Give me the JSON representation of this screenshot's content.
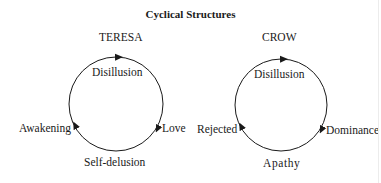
{
  "title": "Cyclical Structures",
  "cycles": [
    {
      "name": "TERESA",
      "top": "Disillusion",
      "right": "Love",
      "bottom": "Self-delusion",
      "left": "Awakening"
    },
    {
      "name": "CROW",
      "top": "Disillusion",
      "right": "Dominance",
      "bottom": "Apathy",
      "left": "Rejected"
    }
  ],
  "colors": {
    "stroke": "#1a1a1a",
    "background": "#ffffff"
  }
}
